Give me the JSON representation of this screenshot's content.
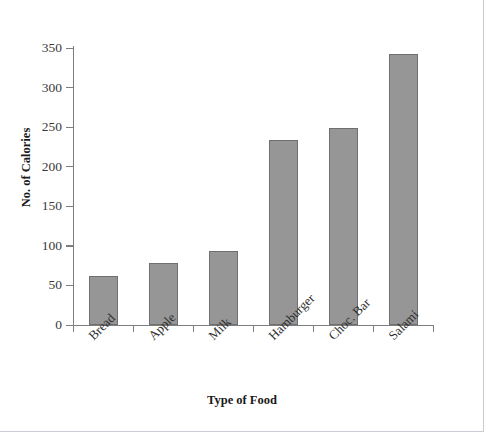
{
  "chart_data": {
    "type": "bar",
    "title": "",
    "xlabel": "Type of Food",
    "ylabel": "No. of Calories",
    "categories": [
      "Bread",
      "Apple",
      "Milk",
      "Hamburger",
      "Choc. Bar",
      "Salami"
    ],
    "values": [
      62,
      78,
      93,
      234,
      249,
      342
    ],
    "ylim": [
      0,
      350
    ],
    "ytick_step": 50,
    "yticks": [
      0,
      50,
      100,
      150,
      200,
      250,
      300,
      350
    ],
    "ytick_labels": [
      "0",
      "50",
      "100",
      "150",
      "200",
      "250",
      "300",
      "350"
    ],
    "grid": false,
    "legend": false,
    "legend_position": "none",
    "colors": {
      "bar_fill": "#969696",
      "bar_border": "#6f6f6f",
      "axis": "#7e7e7e",
      "text": "#2f2f2f",
      "title_text": "#1a1a1a",
      "background": "#ffffff",
      "page_frame": "#c9ccd2"
    }
  }
}
